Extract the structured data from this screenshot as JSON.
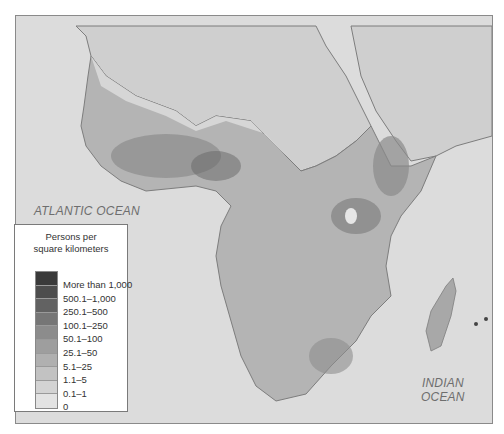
{
  "map": {
    "title": "Population density of Sub-Saharan Africa",
    "labels": {
      "atlantic": "ATLANTIC OCEAN",
      "indian_line1": "INDIAN",
      "indian_line2": "OCEAN"
    },
    "colors": {
      "water": "#dcdcdc",
      "land_outside": "#cfcfcf",
      "border": "#7d7d7d"
    }
  },
  "legend": {
    "title_line1": "Persons per",
    "title_line2": "square kilometers",
    "classes": [
      {
        "label": "More than 1,000",
        "color": "#3a3a3a"
      },
      {
        "label": "500.1–1,000",
        "color": "#4d4d4d"
      },
      {
        "label": "250.1–500",
        "color": "#626262"
      },
      {
        "label": "100.1–250",
        "color": "#767676"
      },
      {
        "label": "50.1–100",
        "color": "#8c8c8c"
      },
      {
        "label": "25.1–50",
        "color": "#9e9e9e"
      },
      {
        "label": "5.1–25",
        "color": "#b0b0b0"
      },
      {
        "label": "1.1–5",
        "color": "#c2c2c2"
      },
      {
        "label": "0.1–1",
        "color": "#d3d3d3"
      },
      {
        "label": "0",
        "color": "#e3e3e3"
      }
    ]
  }
}
